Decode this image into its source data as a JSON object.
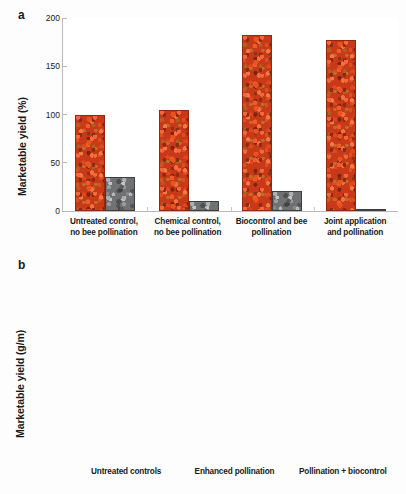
{
  "figure": {
    "background": "#ffffff",
    "red_bar_color": "#c8391a",
    "grey_bar_color": "#6f7173",
    "axis_color": "#b9b9b9"
  },
  "panel_a": {
    "letter": "a",
    "axis_title": "Marketable yield (%)",
    "yticks": [
      "0",
      "50",
      "100",
      "150",
      "200"
    ],
    "categories": [
      "Untreated control,\nno bee pollination",
      "Chemical control,\nno bee pollination",
      "Biocontrol and bee\npollination",
      "Joint application\nand pollination"
    ]
  },
  "panel_b": {
    "letter": "b",
    "axis_title": "Marketable yield (g/m)",
    "yticks": [
      "0",
      "200",
      "400",
      "600",
      "800",
      "1000",
      "1200",
      "1400"
    ],
    "categories": [
      "Untreated controls",
      "Enhanced pollination",
      "Pollination + biocontrol"
    ]
  },
  "chart_data": [
    {
      "type": "bar",
      "panel": "a",
      "title": "",
      "xlabel": "",
      "ylabel": "Marketable yield (%)",
      "ylim": [
        0,
        200
      ],
      "ytick_values": [
        0,
        50,
        100,
        150,
        200
      ],
      "grid": false,
      "legend": "none",
      "categories": [
        "Untreated control, no bee pollination",
        "Chemical control, no bee pollination",
        "Biocontrol and bee pollination",
        "Joint application and pollination"
      ],
      "series": [
        {
          "name": "Marketable yield (red/tomato texture)",
          "fill": "tomato-texture",
          "values": [
            100,
            105,
            182,
            177
          ]
        },
        {
          "name": "Secondary measure (grey/stone texture)",
          "fill": "stone-texture",
          "values": [
            35,
            10,
            21,
            1.5
          ]
        }
      ]
    },
    {
      "type": "bar",
      "panel": "b",
      "title": "",
      "xlabel": "",
      "ylabel": "Marketable yield (g/m)",
      "ylim": [
        0,
        1400
      ],
      "ytick_values": [
        0,
        200,
        400,
        600,
        800,
        1000,
        1200,
        1400
      ],
      "grid": false,
      "legend": "none",
      "categories": [
        "Untreated controls",
        "Enhanced pollination",
        "Pollination + biocontrol"
      ],
      "series": [
        {
          "name": "Marketable yield (red/tomato texture)",
          "fill": "tomato-texture",
          "values": [
            610,
            965,
            1250
          ]
        },
        {
          "name": "Secondary measure (grey/stone texture)",
          "fill": "stone-texture",
          "values": [
            398,
            318,
            302
          ]
        }
      ]
    }
  ]
}
